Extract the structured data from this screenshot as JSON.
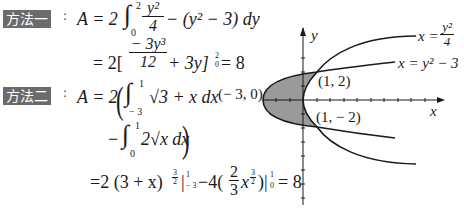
{
  "method1": {
    "tag": "方法一",
    "colon": ":",
    "line1": {
      "lhs": "A = 2",
      "upper": "2",
      "lower": "0",
      "frac_num": "y²",
      "frac_den": "4",
      "rest": "− (y² − 3) dy"
    },
    "line2": {
      "prefix": "= 2[",
      "frac_num": "− 3y³",
      "frac_den": "12",
      "rest": "+ 3y]",
      "sup": "2",
      "sub": "0",
      "result": "= 8"
    }
  },
  "method2": {
    "tag": "方法二",
    "colon": ":",
    "line1": {
      "lhs": "A = 2",
      "upper": "1",
      "lower": "− 3",
      "integrand": "√3 + x dx"
    },
    "line2": {
      "prefix": "−",
      "upper": "1",
      "lower": "0",
      "integrand": "2√x dx"
    },
    "line3": {
      "part1": "=2 (3 + x)",
      "exp1_num": "3",
      "exp1_den": "2",
      "eval1": "|",
      "eval1_sup": "1",
      "eval1_sub": "− 3",
      "part2": "−4(",
      "frac_num": "2",
      "frac_den": "3",
      "x": "x",
      "exp2_num": "3",
      "exp2_den": "2",
      "part3": ")|",
      "eval2_sup": "1",
      "eval2_sub": "0",
      "result": "= 8"
    }
  },
  "graph": {
    "y_axis_label": "y",
    "x_axis_label": "x",
    "curve1_label_lhs": "x =",
    "curve1_label_num": "y²",
    "curve1_label_den": "4",
    "curve2_label": "x = y² − 3",
    "point_vertex": "(− 3, 0)",
    "point_upper": "(1, 2)",
    "point_lower": "(1, − 2)",
    "fill_color": "#9a9a9a",
    "stroke_color": "#1a1a1a"
  }
}
